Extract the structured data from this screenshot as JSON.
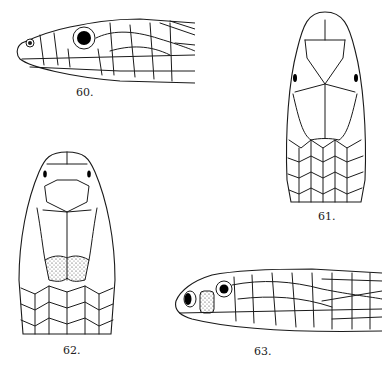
{
  "plate": {
    "background": "#ffffff",
    "ink_color": "#1a1a1a",
    "figures": [
      {
        "id": "60",
        "label": "60.",
        "view": "lateral head, facing left"
      },
      {
        "id": "61",
        "label": "61.",
        "view": "dorsal head"
      },
      {
        "id": "62",
        "label": "62.",
        "view": "dorsal head with stippled parietals"
      },
      {
        "id": "63",
        "label": "63.",
        "view": "lateral head with stippled loreal, facing left"
      }
    ]
  }
}
